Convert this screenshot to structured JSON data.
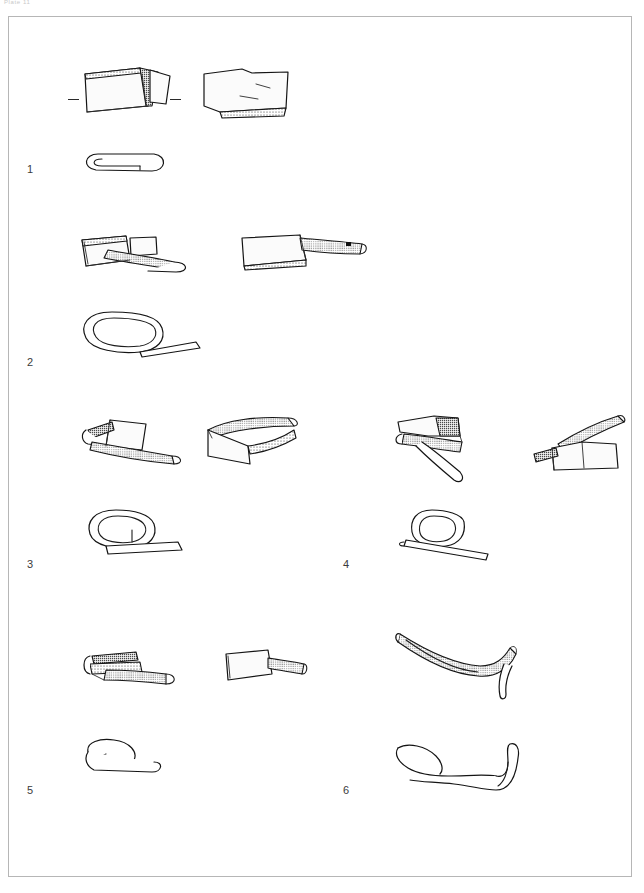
{
  "plate": {
    "caption": "Plate 11",
    "frame": {
      "x": 8,
      "y": 16,
      "width": 624,
      "height": 861,
      "border_color": "#b6b6b6"
    },
    "page_background": "#ffffff",
    "ink_color": "#141414"
  },
  "figures": [
    {
      "number": "1",
      "number_x": 27,
      "number_y": 163,
      "column": "left",
      "description": "Folded sheet-metal band, perspective view with separate detached fragment and profile section below",
      "views": [
        "perspective-left",
        "perspective-right",
        "profile-section"
      ],
      "scale_ticks": 2
    },
    {
      "number": "2",
      "number_x": 27,
      "number_y": 356,
      "column": "left",
      "description": "Looped metal strap, perspective view with second view and coiled profile section below",
      "views": [
        "perspective-left",
        "perspective-right",
        "profile-section"
      ],
      "scale_ticks": 0
    },
    {
      "number": "3",
      "number_x": 27,
      "number_y": 558,
      "column": "left",
      "description": "Tapered looped metal strap with two perspective views and spiral profile section below",
      "views": [
        "perspective-left",
        "perspective-right",
        "profile-section"
      ],
      "scale_ticks": 0
    },
    {
      "number": "4",
      "number_x": 343,
      "number_y": 558,
      "column": "right",
      "description": "Crossed metal strap loop, two perspective views and open loop profile section below",
      "views": [
        "perspective-left",
        "perspective-right",
        "profile-section"
      ],
      "scale_ticks": 0
    },
    {
      "number": "5",
      "number_x": 27,
      "number_y": 784,
      "column": "left",
      "description": "Short hooked metal band, two perspective views and hook profile section below",
      "views": [
        "perspective-left",
        "perspective-right",
        "profile-section"
      ],
      "scale_ticks": 0
    },
    {
      "number": "6",
      "number_x": 343,
      "number_y": 784,
      "column": "right",
      "description": "Curved tapering metal rod with recurved terminal, perspective view and profile section below",
      "views": [
        "perspective",
        "profile-section"
      ],
      "scale_ticks": 0
    }
  ],
  "labels": {
    "one": "1",
    "two": "2",
    "three": "3",
    "four": "4",
    "five": "5",
    "six": "6"
  }
}
